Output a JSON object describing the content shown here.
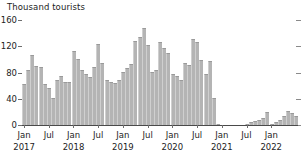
{
  "chart_data": {
    "type": "bar",
    "title": "Thousand tourists",
    "xlabel": "",
    "ylabel": "Thousand tourists",
    "ylim": [
      0,
      160
    ],
    "yticks": [
      0,
      40,
      80,
      120,
      160
    ],
    "ytick_labels": [
      "0",
      "40",
      "80",
      "120",
      "160"
    ],
    "grid": false,
    "legend": null,
    "xtick_months": [
      "Jan",
      "Jul",
      "Jan",
      "Jul",
      "Jan",
      "Jul",
      "Jan",
      "Jul",
      "Jan",
      "Jul",
      "Jan"
    ],
    "xtick_years": [
      "2017",
      "",
      "2018",
      "",
      "2019",
      "",
      "2020",
      "",
      "2021",
      "",
      "2022"
    ],
    "xtick_indices": [
      0,
      6,
      12,
      18,
      24,
      30,
      36,
      42,
      48,
      54,
      60
    ],
    "categories": [
      "Jan 2017",
      "Feb 2017",
      "Mar 2017",
      "Apr 2017",
      "May 2017",
      "Jun 2017",
      "Jul 2017",
      "Aug 2017",
      "Sep 2017",
      "Oct 2017",
      "Nov 2017",
      "Dec 2017",
      "Jan 2018",
      "Feb 2018",
      "Mar 2018",
      "Apr 2018",
      "May 2018",
      "Jun 2018",
      "Jul 2018",
      "Aug 2018",
      "Sep 2018",
      "Oct 2018",
      "Nov 2018",
      "Dec 2018",
      "Jan 2019",
      "Feb 2019",
      "Mar 2019",
      "Apr 2019",
      "May 2019",
      "Jun 2019",
      "Jul 2019",
      "Aug 2019",
      "Sep 2019",
      "Oct 2019",
      "Nov 2019",
      "Dec 2019",
      "Jan 2020",
      "Feb 2020",
      "Mar 2020",
      "Apr 2020",
      "May 2020",
      "Jun 2020",
      "Jul 2020",
      "Aug 2020",
      "Sep 2020",
      "Oct 2020",
      "Nov 2020",
      "Dec 2020",
      "Jan 2021",
      "Feb 2021",
      "Mar 2021",
      "Apr 2021",
      "May 2021",
      "Jun 2021",
      "Jul 2021",
      "Aug 2021",
      "Sep 2021",
      "Oct 2021",
      "Nov 2021",
      "Dec 2021",
      "Jan 2022",
      "Feb 2022"
    ],
    "values": [
      62,
      82,
      105,
      88,
      87,
      62,
      56,
      40,
      68,
      73,
      65,
      64,
      110,
      99,
      82,
      76,
      72,
      87,
      121,
      93,
      67,
      64,
      63,
      67,
      79,
      85,
      91,
      126,
      131,
      145,
      119,
      80,
      83,
      124,
      115,
      107,
      77,
      73,
      68,
      93,
      90,
      128,
      124,
      97,
      77,
      96,
      40,
      1,
      0.5,
      0.4,
      0.5,
      0.6,
      0.5,
      0.6,
      1,
      4,
      6,
      8,
      10,
      19,
      1,
      0.6
    ],
    "values_tail": [
      2,
      4,
      8,
      14,
      21,
      18,
      13
    ],
    "series_color": "#b4b4b4",
    "axis_color": "#4a4a4a"
  }
}
